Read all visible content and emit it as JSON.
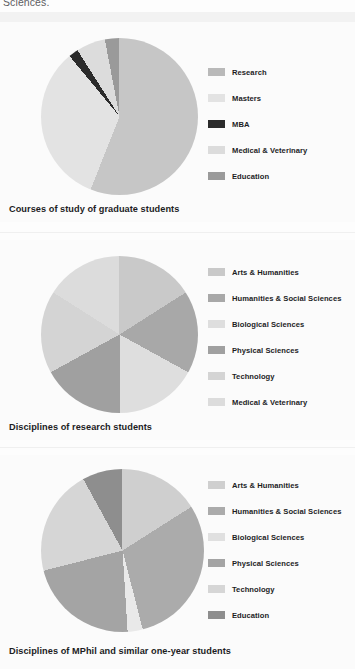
{
  "page": {
    "top_partial_text": "Sciences.",
    "background_color": "#fcfcfc"
  },
  "figures": [
    {
      "caption": "Courses of study of graduate students",
      "legend": [
        {
          "label": "Research",
          "color": "#b9b9b9"
        },
        {
          "label": "Masters",
          "color": "#e3e3e3"
        },
        {
          "label": "MBA",
          "color": "#2b2b2b"
        },
        {
          "label": "Medical & Veterinary",
          "color": "#dcdcdc"
        },
        {
          "label": "Education",
          "color": "#9a9a9a"
        }
      ]
    },
    {
      "caption": "Disciplines of research students",
      "legend": [
        {
          "label": "Arts & Humanities",
          "color": "#c9c9c9"
        },
        {
          "label": "Humanities & Social Sciences",
          "color": "#a8a8a8"
        },
        {
          "label": "Biological Sciences",
          "color": "#dedede"
        },
        {
          "label": "Physical Sciences",
          "color": "#a0a0a0"
        },
        {
          "label": "Technology",
          "color": "#d4d4d4"
        },
        {
          "label": "Medical & Veterinary",
          "color": "#dcdcdc"
        }
      ]
    },
    {
      "caption": "Disciplines of MPhil and similar one-year students",
      "legend": [
        {
          "label": "Arts & Humanities",
          "color": "#cfcfcf"
        },
        {
          "label": "Humanities & Social Sciences",
          "color": "#ababab"
        },
        {
          "label": "Biological Sciences",
          "color": "#e0e0e0"
        },
        {
          "label": "Physical Sciences",
          "color": "#a4a4a4"
        },
        {
          "label": "Technology",
          "color": "#d6d6d6"
        },
        {
          "label": "Education",
          "color": "#8e8e8e"
        }
      ]
    }
  ],
  "chart_data": [
    {
      "type": "pie",
      "title": "Courses of study of graduate students",
      "categories": [
        "Research",
        "Masters",
        "MBA",
        "Medical & Veterinary",
        "Education"
      ],
      "values": [
        56,
        33,
        2,
        6,
        3
      ],
      "colors": [
        "#c6c6c6",
        "#e3e3e3",
        "#2b2b2b",
        "#dcdcdc",
        "#9a9a9a"
      ],
      "legend_position": "right",
      "start_angle": 0,
      "direction": "clockwise"
    },
    {
      "type": "pie",
      "title": "Disciplines of research students",
      "categories": [
        "Arts & Humanities",
        "Humanities & Social Sciences",
        "Biological Sciences",
        "Physical Sciences",
        "Technology",
        "Medical & Veterinary"
      ],
      "values": [
        16,
        17,
        17,
        17,
        17,
        16
      ],
      "colors": [
        "#c9c9c9",
        "#a8a8a8",
        "#dedede",
        "#a0a0a0",
        "#d4d4d4",
        "#dcdcdc"
      ],
      "legend_position": "right",
      "start_angle": 0,
      "direction": "clockwise"
    },
    {
      "type": "pie",
      "title": "Disciplines of MPhil and similar one-year students",
      "categories": [
        "Arts & Humanities",
        "Humanities & Social Sciences",
        "Biological Sciences",
        "Physical Sciences",
        "Technology",
        "Education"
      ],
      "values": [
        16,
        30,
        3,
        22,
        21,
        8
      ],
      "colors": [
        "#cfcfcf",
        "#ababab",
        "#e9e9e9",
        "#a4a4a4",
        "#d6d6d6",
        "#8e8e8e"
      ],
      "legend_position": "right",
      "start_angle": 0,
      "direction": "clockwise"
    }
  ]
}
